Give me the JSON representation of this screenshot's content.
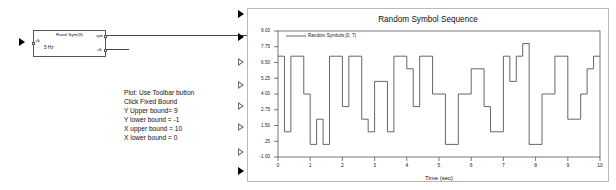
{
  "diagram": {
    "block": {
      "name": "rand-sym-block",
      "title": "Rand Sym(8)",
      "subtitle": "5 Hz",
      "input_label": "clk",
      "out_port_1": "sym",
      "out_port_2": "clk"
    },
    "note": {
      "lines": [
        "Plot: Use Toolbar button",
        "Click Fixed Bound",
        "Y Upper bound= 9",
        "Y lower bound = -1",
        "X upper bound = 10",
        "X lower bound = 0"
      ]
    },
    "ports": [
      {
        "name": "plot-port-1",
        "filled": true
      },
      {
        "name": "plot-port-2",
        "filled": true
      },
      {
        "name": "plot-port-3",
        "filled": false
      },
      {
        "name": "plot-port-4",
        "filled": false
      },
      {
        "name": "plot-port-5",
        "filled": false
      },
      {
        "name": "plot-port-6",
        "filled": false
      },
      {
        "name": "plot-port-7",
        "filled": false
      },
      {
        "name": "plot-port-8",
        "filled": true
      }
    ]
  },
  "chart_data": {
    "type": "line",
    "title": "Random Symbol Sequence",
    "xlabel": "Time (sec)",
    "ylabel": "",
    "legend": [
      "Random Symbols [0, 7]"
    ],
    "legend_position": "top-left",
    "grid": false,
    "xlim": [
      0,
      10
    ],
    "ylim": [
      -1,
      9
    ],
    "xticks": [
      "0",
      "1",
      "2",
      "3",
      "4",
      "5",
      "6",
      "7",
      "8",
      "9",
      "10"
    ],
    "xtick_values": [
      0,
      1,
      2,
      3,
      4,
      5,
      6,
      7,
      8,
      9,
      10
    ],
    "yticks": [
      "9.00",
      "7.75",
      "6.50",
      "5.25",
      "4.00",
      "2.75",
      "1.50",
      ".25",
      "-1.00"
    ],
    "ytick_values": [
      9.0,
      7.75,
      6.5,
      5.25,
      4.0,
      2.75,
      1.5,
      0.25,
      -1.0
    ],
    "step_interpolation": "post",
    "sample_period": 0.2,
    "series": [
      {
        "name": "Random Symbols [0, 7]",
        "color": "#555555",
        "x": [
          0.0,
          0.2,
          0.4,
          0.6,
          0.8,
          1.0,
          1.2,
          1.4,
          1.6,
          1.8,
          2.0,
          2.2,
          2.4,
          2.6,
          2.8,
          3.0,
          3.2,
          3.4,
          3.6,
          3.8,
          4.0,
          4.2,
          4.4,
          4.6,
          4.8,
          5.0,
          5.2,
          5.4,
          5.6,
          5.8,
          6.0,
          6.2,
          6.4,
          6.6,
          6.8,
          7.0,
          7.2,
          7.4,
          7.6,
          7.8,
          8.0,
          8.2,
          8.4,
          8.6,
          8.8,
          9.0,
          9.2,
          9.4,
          9.6,
          9.8,
          10.0
        ],
        "values": [
          7,
          1,
          7,
          7,
          4,
          0,
          2,
          0,
          7,
          7,
          3,
          7,
          7,
          2,
          1,
          5,
          5,
          1,
          7,
          7,
          6,
          3,
          7,
          7,
          4,
          4,
          0,
          0,
          4,
          4,
          6,
          6,
          3,
          1,
          1,
          7,
          5,
          7,
          8,
          0,
          0,
          4,
          4,
          7,
          7,
          2,
          2,
          4,
          6,
          7,
          7
        ]
      }
    ]
  }
}
